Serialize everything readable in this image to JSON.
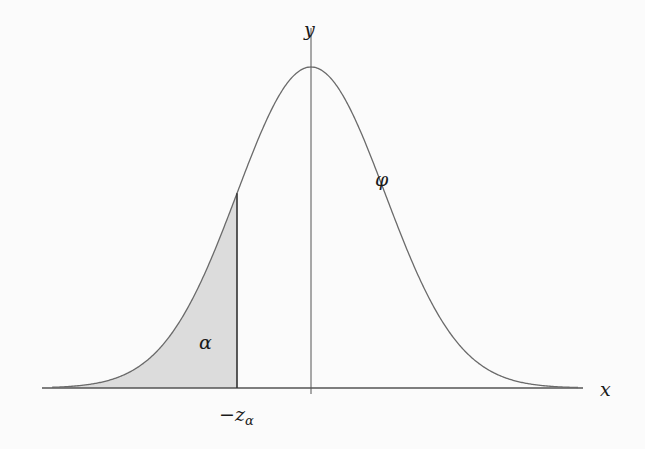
{
  "diagram": {
    "type": "normal-distribution-lower-tail",
    "labels": {
      "y_axis": "y",
      "x_axis": "x",
      "curve": "φ",
      "area": "α",
      "cutoff_prefix": "−z",
      "cutoff_sub": "α"
    },
    "colors": {
      "curve": "#6a6a6a",
      "axes": "#555555",
      "shade": "#dcdcdc",
      "cutoff_line": "#333333"
    },
    "geometry": {
      "axis_y": 388,
      "axis_x_start": 42,
      "axis_x_end": 583,
      "center_x": 311,
      "peak_y": 67,
      "sigma_px": 74,
      "cutoff_x": 237,
      "y_axis_top": 28,
      "y_axis_bottom": 394
    }
  }
}
